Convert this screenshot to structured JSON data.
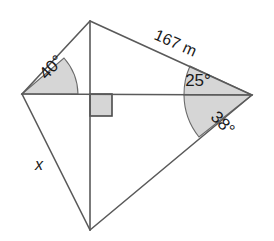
{
  "diagram": {
    "type": "geometry-figure",
    "stroke_color": "#5a5a5a",
    "fill_color": "#d6d6d6",
    "background_color": "#ffffff",
    "vertices": [
      {
        "name": "left-vertex",
        "x": 22,
        "y": 94
      },
      {
        "name": "top-vertex",
        "x": 90,
        "y": 21
      },
      {
        "name": "right-vertex",
        "x": 252,
        "y": 95
      },
      {
        "name": "bottom-vertex",
        "x": 90,
        "y": 230
      },
      {
        "name": "center-intersection",
        "x": 90,
        "y": 94
      }
    ],
    "angles": [
      {
        "name": "angle-40",
        "value": "40",
        "unit": "°",
        "label": "40°",
        "at_vertex": "left-vertex",
        "label_x": 52,
        "label_y": 68,
        "label_rotation": -46
      },
      {
        "name": "angle-25",
        "value": "25",
        "unit": "°",
        "label": "25°",
        "at_vertex": "right-vertex",
        "label_x": 198,
        "label_y": 82,
        "label_rotation": 0
      },
      {
        "name": "angle-38",
        "value": "38",
        "unit": "°",
        "label": "38°",
        "at_vertex": "right-vertex",
        "label_x": 222,
        "label_y": 124,
        "label_rotation": 46
      }
    ],
    "side_labels": [
      {
        "name": "side-167m",
        "label": "167 m",
        "value": "167",
        "unit": "m",
        "on_edge": "top-vertex-to-right-vertex",
        "label_x": 175,
        "label_y": 44,
        "label_rotation": 24
      },
      {
        "name": "side-x",
        "label": "x",
        "value": "x",
        "unit": "",
        "on_edge": "left-vertex-to-bottom-vertex",
        "label_x": 39,
        "label_y": 166,
        "label_rotation": 0
      }
    ],
    "right_angle_marker": {
      "name": "right-angle-marker",
      "label": "90°",
      "at_vertex": "center-intersection",
      "x": 90,
      "y": 94,
      "size": 22
    }
  }
}
